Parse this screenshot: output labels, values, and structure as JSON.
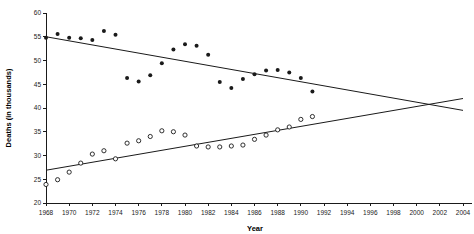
{
  "chart_data": {
    "type": "scatter",
    "title": "",
    "xlabel": "Year",
    "ylabel": "Deaths (in thousands)",
    "xlim": [
      1968,
      2004
    ],
    "ylim": [
      20,
      60
    ],
    "grid": false,
    "legend": "none",
    "xticks": [
      1968,
      1970,
      1972,
      1974,
      1976,
      1978,
      1980,
      1982,
      1984,
      1986,
      1988,
      1990,
      1992,
      1994,
      1996,
      1998,
      2000,
      2002,
      2004
    ],
    "yticks": [
      20,
      25,
      30,
      35,
      40,
      45,
      50,
      55,
      60
    ],
    "series": [
      {
        "name": "filled-circles-upper",
        "marker": "filled-circle",
        "color": "#1a1a1a",
        "x": [
          1968,
          1969,
          1970,
          1971,
          1972,
          1973,
          1974,
          1975,
          1976,
          1977,
          1978,
          1979,
          1980,
          1981,
          1982,
          1983,
          1984,
          1985,
          1986,
          1987,
          1988,
          1989,
          1990,
          1991
        ],
        "values": [
          54.8,
          55.6,
          54.8,
          54.7,
          54.3,
          56.2,
          55.4,
          46.3,
          45.6,
          46.9,
          49.4,
          52.3,
          53.4,
          53.1,
          51.2,
          45.5,
          44.2,
          46.1,
          47.1,
          47.9,
          48.0,
          47.5,
          46.3,
          43.5
        ],
        "trend_line": {
          "x": [
            1968,
            2004
          ],
          "y": [
            55.0,
            39.5
          ]
        }
      },
      {
        "name": "open-circles-lower",
        "marker": "open-circle",
        "color": "#1a1a1a",
        "x": [
          1968,
          1969,
          1970,
          1971,
          1972,
          1973,
          1974,
          1975,
          1976,
          1977,
          1978,
          1979,
          1980,
          1981,
          1982,
          1983,
          1984,
          1985,
          1986,
          1987,
          1988,
          1989,
          1990,
          1991
        ],
        "values": [
          23.9,
          24.9,
          26.5,
          28.4,
          30.3,
          31.0,
          29.3,
          32.6,
          33.1,
          34.0,
          35.2,
          35.0,
          34.3,
          32.0,
          31.8,
          31.8,
          32.0,
          32.2,
          33.4,
          34.3,
          35.4,
          36.0,
          37.6,
          38.2
        ],
        "trend_line": {
          "x": [
            1968,
            2004
          ],
          "y": [
            26.9,
            42.0
          ]
        }
      }
    ]
  }
}
